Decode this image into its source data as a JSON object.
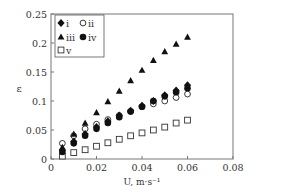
{
  "chart_data": {
    "type": "scatter",
    "title": "",
    "xlabel": "U, m·s⁻¹",
    "ylabel": "ε",
    "xlim": [
      0,
      0.08
    ],
    "ylim": [
      0,
      0.25
    ],
    "xticks": [
      0,
      0.02,
      0.04,
      0.06,
      0.08
    ],
    "xtick_labels": [
      "0",
      "0.02",
      "0.04",
      "0.06",
      "0.08"
    ],
    "yticks": [
      0,
      0.05,
      0.1,
      0.15,
      0.2,
      0.25
    ],
    "ytick_labels": [
      "0",
      "0.05",
      "0.1",
      "0.15",
      "0.2",
      "0.25"
    ],
    "grid": false,
    "legend_position": "upper left",
    "x": [
      0.005,
      0.01,
      0.015,
      0.02,
      0.025,
      0.03,
      0.035,
      0.04,
      0.045,
      0.05,
      0.055,
      0.06
    ],
    "series": [
      {
        "name": "i",
        "marker": "filled-diamond",
        "values": [
          0.015,
          0.03,
          0.043,
          0.055,
          0.065,
          0.075,
          0.083,
          0.092,
          0.1,
          0.11,
          0.118,
          0.127
        ]
      },
      {
        "name": "ii",
        "marker": "open-circle",
        "values": [
          0.027,
          0.04,
          0.052,
          0.06,
          0.068,
          0.075,
          0.082,
          0.09,
          0.095,
          0.1,
          0.106,
          0.112
        ]
      },
      {
        "name": "iii",
        "marker": "filled-triangle",
        "values": [
          0.02,
          0.043,
          0.062,
          0.08,
          0.099,
          0.117,
          0.135,
          0.153,
          0.17,
          0.185,
          0.198,
          0.21
        ]
      },
      {
        "name": "iv",
        "marker": "filled-circle",
        "values": [
          0.012,
          0.027,
          0.04,
          0.052,
          0.062,
          0.072,
          0.082,
          0.09,
          0.1,
          0.108,
          0.115,
          0.122
        ]
      },
      {
        "name": "v",
        "marker": "open-square",
        "values": [
          0.005,
          0.011,
          0.016,
          0.022,
          0.028,
          0.034,
          0.04,
          0.045,
          0.05,
          0.055,
          0.062,
          0.067
        ]
      }
    ]
  },
  "legend": {
    "items": [
      {
        "label": "i"
      },
      {
        "label": "ii"
      },
      {
        "label": "iii"
      },
      {
        "label": "iv"
      },
      {
        "label": "v"
      }
    ]
  }
}
